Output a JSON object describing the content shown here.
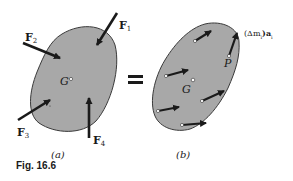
{
  "figure": {
    "caption": "Fig. 16.6",
    "equals_sign": "=",
    "colors": {
      "body_fill": "#a8a8a8",
      "body_stroke": "#3a3a3a",
      "arrow": "#1a1a1a",
      "background": "#ffffff"
    }
  },
  "panel_a": {
    "label": "(a)",
    "center_label": "G",
    "forces": [
      {
        "symbol": "F",
        "sub": "1"
      },
      {
        "symbol": "F",
        "sub": "2"
      },
      {
        "symbol": "F",
        "sub": "3"
      },
      {
        "symbol": "F",
        "sub": "4"
      }
    ]
  },
  "panel_b": {
    "label": "(b)",
    "center_label": "G",
    "point_label": "P",
    "effective_force_label": "(Δm",
    "effective_force_sub": "i",
    "effective_force_tail": ")a",
    "effective_force_tail_sub": "i",
    "arrow_count": 6
  }
}
